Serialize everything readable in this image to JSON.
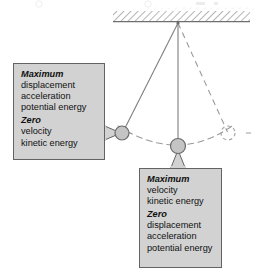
{
  "figure": {
    "colors": {
      "callout_fill": "#d2d2d2",
      "callout_border": "#636363",
      "bob_fill": "#c4c4c4",
      "bob_border": "#6a6a6a",
      "string": "#808080",
      "dashed": "#999999",
      "ceiling_hatch": "#8c8c8c",
      "text": "#111111"
    }
  },
  "diagram": {
    "ceiling": {
      "label": "support-ceiling"
    },
    "pivot": {
      "label": "pivot-point",
      "x": 178,
      "y": 24
    },
    "bobs": [
      {
        "label": "bob-left-extreme",
        "x": 122,
        "y": 133,
        "style": "solid"
      },
      {
        "label": "bob-lowest-point",
        "x": 178,
        "y": 146,
        "style": "solid"
      },
      {
        "label": "bob-right-extreme",
        "x": 228,
        "y": 133,
        "style": "dashed"
      }
    ],
    "strings": [
      {
        "label": "string-left",
        "style": "solid"
      },
      {
        "label": "string-center",
        "style": "solid"
      },
      {
        "label": "string-right",
        "style": "dashed"
      }
    ],
    "arc": {
      "label": "swing-path-arc",
      "style": "dashed"
    }
  },
  "callout_left": {
    "max_heading": "Maximum",
    "max_items": [
      "displacement",
      "acceleration",
      "potential energy"
    ],
    "zero_heading": "Zero",
    "zero_items": [
      "velocity",
      "kinetic energy"
    ]
  },
  "callout_bottom": {
    "max_heading": "Maximum",
    "max_items": [
      "velocity",
      "kinetic energy"
    ],
    "zero_heading": "Zero",
    "zero_items": [
      "displacement",
      "acceleration",
      "potential energy"
    ]
  }
}
